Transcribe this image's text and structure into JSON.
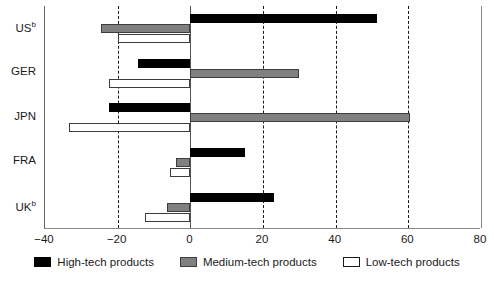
{
  "chart_data": {
    "type": "bar",
    "orientation": "horizontal",
    "title": "",
    "subtitle": "",
    "xlabel": "",
    "ylabel": "",
    "xlim": [
      -40,
      80
    ],
    "xticks": [
      -40,
      -20,
      0,
      20,
      40,
      60,
      80
    ],
    "xticklabels": [
      "−40",
      "−20",
      "0",
      "20",
      "40",
      "60",
      "80"
    ],
    "grid": true,
    "grid_axis": "x",
    "grid_style": "dashed",
    "legend_position": "bottom",
    "categories": [
      "US",
      "GER",
      "JPN",
      "FRA",
      "UK"
    ],
    "category_labels_html": [
      "US<sup>b</sup>",
      "GER",
      "JPN",
      "FRA",
      "UK<sup>b</sup>"
    ],
    "category_footnotes": {
      "US": "b",
      "UK": "b"
    },
    "series": [
      {
        "name": "High-tech products",
        "color": "#000000",
        "values": [
          51.5,
          -14.5,
          -22.5,
          15.0,
          23.0
        ]
      },
      {
        "name": "Medium-tech products",
        "color": "#808080",
        "values": [
          -24.5,
          30.0,
          60.5,
          -4.0,
          -6.5
        ]
      },
      {
        "name": "Low-tech products",
        "color": "#ffffff",
        "values": [
          -20.0,
          -22.5,
          -33.5,
          -5.5,
          -12.5
        ]
      }
    ]
  },
  "axis": {
    "ticks": [
      {
        "value": -40,
        "label": "−40"
      },
      {
        "value": -20,
        "label": "−20"
      },
      {
        "value": 0,
        "label": "0"
      },
      {
        "value": 20,
        "label": "20"
      },
      {
        "value": 40,
        "label": "40"
      },
      {
        "value": 60,
        "label": "60"
      },
      {
        "value": 80,
        "label": "80"
      }
    ]
  },
  "categories": [
    {
      "key": "us",
      "label": "US",
      "sup": "b"
    },
    {
      "key": "ger",
      "label": "GER",
      "sup": ""
    },
    {
      "key": "jpn",
      "label": "JPN",
      "sup": ""
    },
    {
      "key": "fra",
      "label": "FRA",
      "sup": ""
    },
    {
      "key": "uk",
      "label": "UK",
      "sup": "b"
    }
  ],
  "legend": {
    "items": [
      {
        "key": "high",
        "label": "High-tech products",
        "color": "#000000"
      },
      {
        "key": "medium",
        "label": "Medium-tech products",
        "color": "#808080"
      },
      {
        "key": "low",
        "label": "Low-tech products",
        "color": "#ffffff"
      }
    ]
  },
  "colors": {
    "high_tech": "#000000",
    "medium_tech": "#808080",
    "low_tech": "#ffffff",
    "axis": "#1a1a1a",
    "grid": "#1a1a1a",
    "background": "#ffffff"
  }
}
